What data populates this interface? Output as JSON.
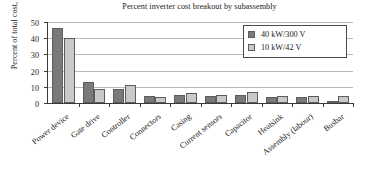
{
  "chart_data": {
    "type": "bar",
    "title": "Percent inverter cost breakout by subassembly",
    "xlabel": "",
    "ylabel": "Percent of total cost, $",
    "ylim": [
      0,
      50
    ],
    "yticks": [
      0,
      10,
      20,
      30,
      40,
      50
    ],
    "grid": true,
    "legend_position": "top-right",
    "categories": [
      "Power device",
      "Gate drive",
      "Controller",
      "Connectors",
      "Casing",
      "Current sensors",
      "Capacitor",
      "Heatsink",
      "Assembly (labour)",
      "Busbar"
    ],
    "series": [
      {
        "name": "40 kW/300 V",
        "color": "#7a7a7a",
        "values": [
          46.5,
          12.7,
          8.7,
          4.6,
          4.7,
          4.2,
          5.1,
          3.5,
          3.5,
          1.5
        ]
      },
      {
        "name": "10 kW/42 V",
        "color": "#c9c9c9",
        "values": [
          40.0,
          8.5,
          11.2,
          3.6,
          6.1,
          5.2,
          7.1,
          4.4,
          4.5,
          4.5
        ]
      }
    ]
  },
  "legend": {
    "items": [
      {
        "label": "40 kW/300 V"
      },
      {
        "label": "10 kW/42 V"
      }
    ]
  }
}
